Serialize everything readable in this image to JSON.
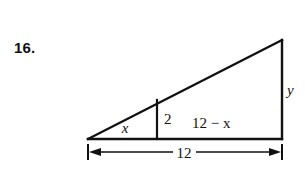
{
  "page": {
    "background_color": "#ffffff",
    "ink_color": "#111111",
    "width": 305,
    "height": 181
  },
  "problem": {
    "number_label": "16."
  },
  "figure": {
    "type": "geometry-diagram",
    "shape": "right-triangle-with-interior-altitude",
    "labels": {
      "base_left_segment": "x",
      "interior_vertical": "2",
      "base_right_segment": "12 − x",
      "right_leg": "y",
      "overall_base_dimension": "12"
    },
    "geometry": {
      "left_vertex": [
        88,
        139
      ],
      "bottom_right_vertex": [
        282,
        139
      ],
      "top_right_vertex": [
        282,
        40
      ],
      "interior_vertical_x": 157,
      "interior_vertical_top_y": 100,
      "interior_vertical_bottom_y": 139,
      "dimension_line_y": 152,
      "dimension_line_x1": 88,
      "dimension_line_x2": 282,
      "dimension_gap_x1": 173,
      "dimension_gap_x2": 196
    },
    "label_positions": {
      "base_left_segment": [
        125,
        133
      ],
      "interior_vertical": [
        164,
        124
      ],
      "base_right_segment": [
        192,
        128
      ],
      "right_leg": [
        287,
        95
      ],
      "overall_base_dimension": [
        176,
        158
      ]
    }
  }
}
